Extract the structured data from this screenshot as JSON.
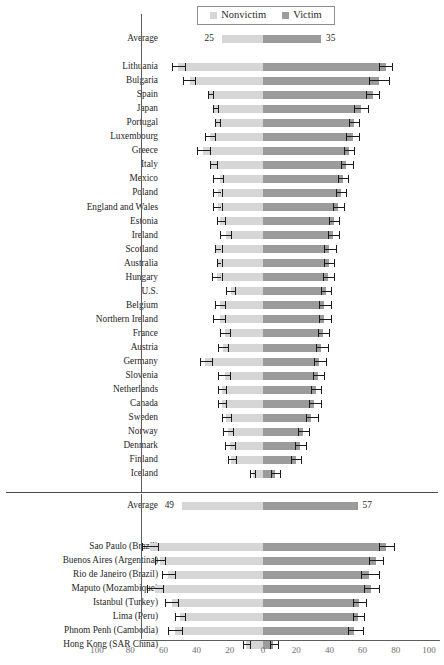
{
  "chart_data": {
    "type": "bar",
    "title": "",
    "subtitle": "",
    "xlabel": "",
    "ylabel": "",
    "orientation": "horizontal",
    "style": "diverging-stacked",
    "xlim": [
      -100,
      100
    ],
    "xticks": [
      -100,
      -80,
      -60,
      -40,
      -20,
      0,
      20,
      40,
      60,
      80,
      100
    ],
    "xtick_labels": [
      "100",
      "80",
      "60",
      "40",
      "20",
      "0",
      "20",
      "40",
      "60",
      "80",
      "100"
    ],
    "grid": false,
    "legend": {
      "position": "top-center",
      "entries": [
        {
          "name": "Nonvictim",
          "color": "#d6d6d6",
          "side": "left"
        },
        {
          "name": "Victim",
          "color": "#9b9b9b",
          "side": "right"
        }
      ]
    },
    "colors": {
      "nonvictim": "#d6d6d6",
      "victim": "#9b9b9b",
      "errorbar": "#1c1c1c"
    },
    "panels": [
      {
        "name": "countries",
        "average": {
          "label": "Average",
          "nonvictim": 25,
          "victim": 35,
          "nonvictim_label": "25",
          "victim_label": "35"
        },
        "categories": [
          "Lithuania",
          "Bulgaria",
          "Spain",
          "Japan",
          "Portugal",
          "Luxembourg",
          "Greece",
          "Italy",
          "Mexico",
          "Poland",
          "England and Wales",
          "Estonia",
          "Ireland",
          "Scotland",
          "Australia",
          "Hungary",
          "U.S.",
          "Belgium",
          "Northern Ireland",
          "France",
          "Austria",
          "Germany",
          "Slovenia",
          "Netherlands",
          "Canada",
          "Sweden",
          "Norway",
          "Denmark",
          "Finland",
          "Iceland"
        ],
        "series": [
          {
            "name": "Nonvictim",
            "values": [
              51,
              44,
              33,
              30,
              29,
              32,
              36,
              32,
              26,
              27,
              27,
              26,
              22,
              29,
              28,
              28,
              19,
              26,
              26,
              23,
              24,
              35,
              23,
              25,
              25,
              22,
              21,
              20,
              19,
              6
            ],
            "err_low": [
              55,
              48,
              33,
              30,
              29,
              35,
              40,
              32,
              30,
              30,
              30,
              28,
              26,
              29,
              28,
              31,
              22,
              29,
              30,
              26,
              27,
              38,
              27,
              27,
              27,
              25,
              24,
              23,
              21,
              8
            ],
            "err_high": [
              47,
              41,
              30,
              27,
              26,
              29,
              32,
              28,
              24,
              25,
              25,
              23,
              19,
              25,
              25,
              25,
              17,
              23,
              23,
              20,
              21,
              31,
              20,
              22,
              22,
              19,
              18,
              17,
              16,
              5
            ]
          },
          {
            "name": "Victim",
            "values": [
              74,
              70,
              66,
              59,
              55,
              54,
              52,
              50,
              48,
              47,
              45,
              43,
              42,
              40,
              40,
              39,
              38,
              37,
              37,
              36,
              35,
              34,
              33,
              32,
              31,
              29,
              24,
              22,
              20,
              7
            ],
            "err_low": [
              70,
              64,
              62,
              55,
              52,
              50,
              49,
              47,
              45,
              44,
              42,
              40,
              39,
              37,
              37,
              36,
              35,
              34,
              34,
              33,
              32,
              31,
              30,
              29,
              28,
              26,
              21,
              19,
              17,
              5
            ],
            "err_high": [
              78,
              76,
              70,
              63,
              58,
              58,
              55,
              54,
              51,
              50,
              49,
              46,
              46,
              44,
              43,
              43,
              41,
              41,
              41,
              40,
              39,
              38,
              37,
              35,
              35,
              33,
              28,
              26,
              23,
              10
            ]
          }
        ]
      },
      {
        "name": "cities",
        "average": {
          "label": "Average",
          "nonvictim": 49,
          "victim": 57,
          "nonvictim_label": "49",
          "victim_label": "57"
        },
        "categories": [
          "Sao Paulo (Brazil)",
          "Buenos Aires (Argentina)",
          "Rio de Janeiro (Brazil)",
          "Maputo (Mozambique)",
          "Istanbul (Turkey)",
          "Lima (Peru)",
          "Phnom Penh (Cambodia)",
          "Hong Kong (SAR China)"
        ],
        "series": [
          {
            "name": "Nonvictim",
            "values": [
              68,
              62,
              57,
              65,
              55,
              50,
              53,
              10
            ],
            "err_low": [
              73,
              65,
              61,
              70,
              59,
              53,
              57,
              12
            ],
            "err_high": [
              63,
              59,
              53,
              60,
              51,
              47,
              49,
              8
            ]
          },
          {
            "name": "Victim",
            "values": [
              74,
              68,
              64,
              65,
              58,
              57,
              55,
              6
            ],
            "err_low": [
              70,
              64,
              59,
              61,
              54,
              54,
              51,
              4
            ],
            "err_high": [
              79,
              72,
              70,
              70,
              62,
              61,
              60,
              9
            ]
          }
        ]
      }
    ]
  }
}
